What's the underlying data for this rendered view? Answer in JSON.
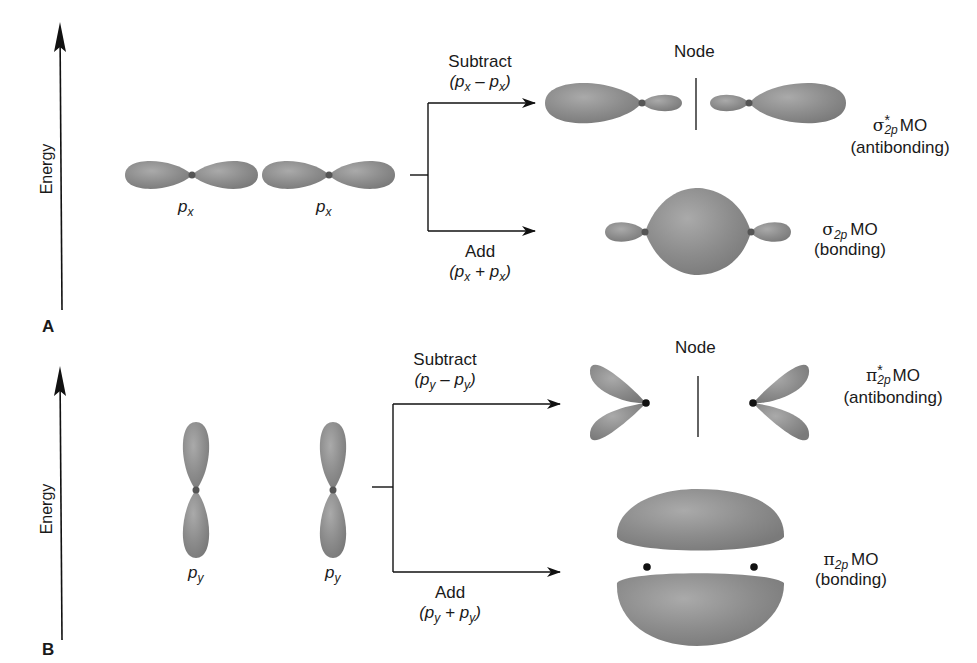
{
  "panels": {
    "A": {
      "label": "A",
      "axis_label": "Energy",
      "atomic_orbitals": [
        {
          "symbol": "p",
          "subscript": "x"
        },
        {
          "symbol": "p",
          "subscript": "x"
        }
      ],
      "subtract": {
        "label": "Subtract",
        "expr_open": "(",
        "expr_p1": "p",
        "expr_s1": "x",
        "expr_op": " – ",
        "expr_p2": "p",
        "expr_s2": "x",
        "expr_close": ")"
      },
      "add": {
        "label": "Add",
        "expr_open": "(",
        "expr_p1": "p",
        "expr_s1": "x",
        "expr_op": " + ",
        "expr_p2": "p",
        "expr_s2": "x",
        "expr_close": ")"
      },
      "node_label": "Node",
      "antibonding_mo": {
        "greek": "σ",
        "superscript": "*",
        "subscript": "2p",
        "suffix": "MO",
        "type": "(antibonding)"
      },
      "bonding_mo": {
        "greek": "σ",
        "subscript": "2p",
        "suffix": "MO",
        "type": "(bonding)"
      }
    },
    "B": {
      "label": "B",
      "axis_label": "Energy",
      "atomic_orbitals": [
        {
          "symbol": "p",
          "subscript": "y"
        },
        {
          "symbol": "p",
          "subscript": "y"
        }
      ],
      "subtract": {
        "label": "Subtract",
        "expr_open": "(",
        "expr_p1": "p",
        "expr_s1": "y",
        "expr_op": " – ",
        "expr_p2": "p",
        "expr_s2": "y",
        "expr_close": ")"
      },
      "add": {
        "label": "Add",
        "expr_open": "(",
        "expr_p1": "p",
        "expr_s1": "y",
        "expr_op": " + ",
        "expr_p2": "p",
        "expr_s2": "y",
        "expr_close": ")"
      },
      "node_label": "Node",
      "antibonding_mo": {
        "greek": "π",
        "superscript": "*",
        "subscript": "2p",
        "suffix": "MO",
        "type": "(antibonding)"
      },
      "bonding_mo": {
        "greek": "π",
        "subscript": "2p",
        "suffix": "MO",
        "type": "(bonding)"
      }
    }
  },
  "colors": {
    "lobe_fill": "#8a8a8a",
    "lobe_highlight": "#a9a9a9",
    "nucleus": "#333333",
    "line": "#1a1a1a"
  }
}
